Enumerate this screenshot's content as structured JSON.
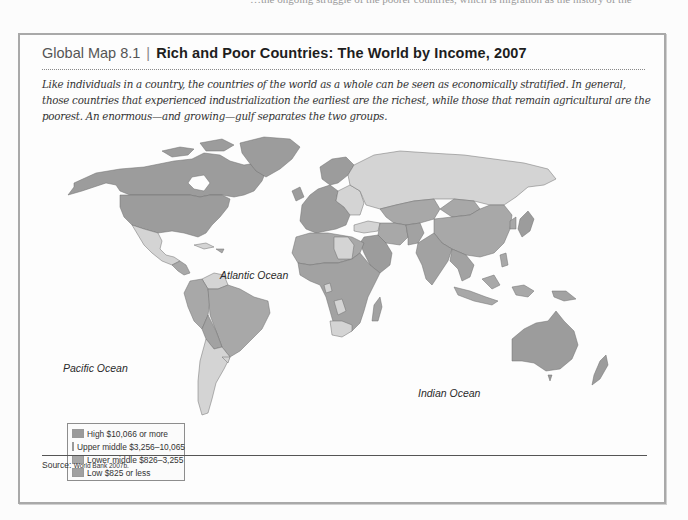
{
  "page_cutoff_text": "…the ongoing struggle of the poorer countries, which is migration as the history of the",
  "figure": {
    "label": "Global Map 8.1",
    "separator": "|",
    "title": "Rich and Poor Countries: The World by Income, 2007",
    "caption": "Like individuals in a country, the countries of the world as a whole can be seen as economically stratified. In general, those countries that experienced industrialization the earliest are the richest, while those that remain agricultural are the poorest. An enormous—and growing—gulf separates the two groups."
  },
  "map": {
    "oceans": [
      {
        "name": "Atlantic Ocean"
      },
      {
        "name": "Pacific Ocean"
      },
      {
        "name": "Indian Ocean"
      }
    ],
    "legend": [
      {
        "label": "High $10,066 or more",
        "color": "#9a9a9a"
      },
      {
        "label": "Upper middle $3,256–10,065",
        "color": "#d6d6d6"
      },
      {
        "label": "Lower middle $826–3,255",
        "color": "#a6a6a6"
      },
      {
        "label": "Low $825 or less",
        "color": "#a0a0a0"
      }
    ],
    "colors": {
      "high": "#9c9c9c",
      "upper_middle": "#d4d4d4",
      "lower_middle": "#a8a8a8",
      "low": "#a2a2a2",
      "border": "#6e6e6e"
    }
  },
  "source": {
    "label": "Source:",
    "value": "World Bank 2007b."
  }
}
